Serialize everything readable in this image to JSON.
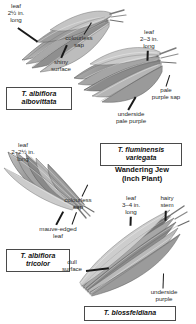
{
  "figure": {
    "title_visible": false,
    "type": "botanical-identification-plate"
  },
  "palette": {
    "text": "#2b2b2b",
    "name_text": "#111111",
    "leader_line": "#1a1a1a",
    "box_border": "#4a4a4a",
    "background": "#ffffff",
    "leaf_dark": "#6f6f6f",
    "leaf_mid": "#9a9a9a",
    "leaf_light": "#c9c9c9"
  },
  "specimens": [
    {
      "id": "albovittata",
      "name_line1": "T. albiflora",
      "name_line2": "albovittata",
      "labels": [
        {
          "key": "leaf-size",
          "text": "leaf\n2½ in.\nlong"
        },
        {
          "key": "sap",
          "text": "colourless\nsap"
        },
        {
          "key": "surface",
          "text": "shiny\nsurface"
        }
      ]
    },
    {
      "id": "fluminensis-variegata",
      "name_line1": "T. fluminensis",
      "name_line2": "variegata",
      "caption_line1": "Wandering Jew",
      "caption_line2": "(Inch Plant)",
      "labels": [
        {
          "key": "leaf-size",
          "text": "leaf\n2–3 in.\nlong"
        },
        {
          "key": "sap",
          "text": "pale\npurple sap"
        },
        {
          "key": "underside",
          "text": "underside\npale purple"
        }
      ]
    },
    {
      "id": "tricolor",
      "name_line1": "T. albiflora",
      "name_line2": "tricolor",
      "labels": [
        {
          "key": "leaf-size",
          "text": "leaf\n2–2½ in.\nlong"
        },
        {
          "key": "sap",
          "text": "colourless\nsap"
        },
        {
          "key": "edge",
          "text": "mauve-edged\nleaf"
        }
      ]
    },
    {
      "id": "blossfeldiana",
      "name_line1": "T. blossfeldiana",
      "name_line2": "",
      "labels": [
        {
          "key": "leaf-size",
          "text": "leaf\n3–4 in.\nlong"
        },
        {
          "key": "stem",
          "text": "hairy\nstem"
        },
        {
          "key": "surface",
          "text": "dull\nsurface"
        },
        {
          "key": "underside",
          "text": "underside\npurple"
        }
      ]
    }
  ]
}
